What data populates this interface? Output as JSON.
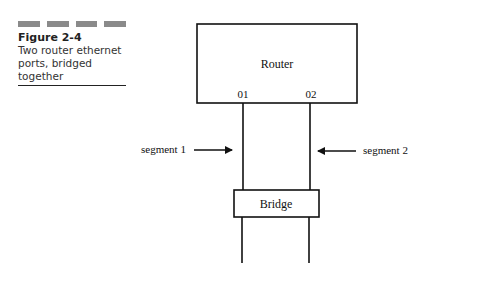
{
  "caption": {
    "figure_number": "Figure 2-4",
    "text": "Two router ethernet ports, bridged together"
  },
  "diagram": {
    "router_label": "Router",
    "port_1": "01",
    "port_2": "02",
    "segment_1": "segment 1",
    "segment_2": "segment 2",
    "bridge_label": "Bridge"
  }
}
